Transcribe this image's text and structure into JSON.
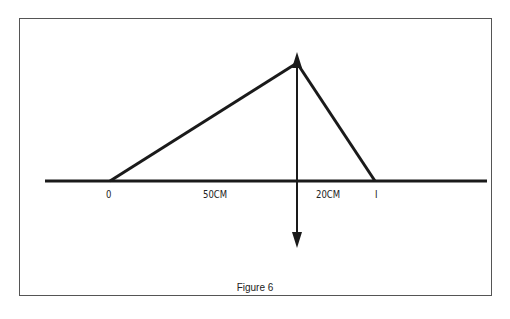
{
  "figure": {
    "caption": "Figure 6",
    "labels": {
      "origin": "0",
      "object_distance": "50CM",
      "image_distance": "20CM",
      "image_point": "I"
    },
    "colors": {
      "line": "#1a1a1a",
      "frame": "#555555",
      "background": "#ffffff"
    }
  },
  "diagram_data": {
    "type": "thin-lens ray diagram",
    "elements": [
      {
        "name": "optical-axis",
        "kind": "line"
      },
      {
        "name": "converging-lens",
        "kind": "double-arrow",
        "position": "between 0 and I"
      },
      {
        "name": "ray-object-to-lens",
        "from": "0",
        "to": "lens-top"
      },
      {
        "name": "ray-lens-to-image",
        "from": "lens-top",
        "to": "I"
      }
    ],
    "distances": {
      "object_to_lens": "50CM",
      "lens_to_image": "20CM"
    }
  }
}
